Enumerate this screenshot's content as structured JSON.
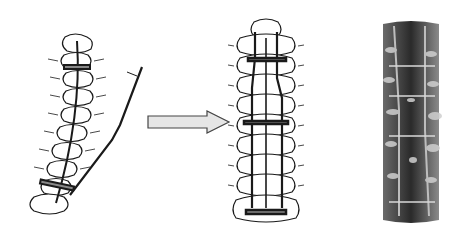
{
  "figure": {
    "panels": [
      {
        "id": "before",
        "label": "Curved spine with single bent rod and hooks (pre-correction)"
      },
      {
        "id": "arrow",
        "label": "Correction direction arrow"
      },
      {
        "id": "after",
        "label": "Straightened spine with dual rods and cross-links (post-correction)"
      },
      {
        "id": "photo",
        "label": "Intraoperative photograph of instrumented spine"
      }
    ],
    "colors": {
      "background": "#ffffff",
      "ink": "#1a1a1a",
      "bone": "#ffffff",
      "arrow_fill": "#e6e6e6",
      "arrow_stroke": "#444444",
      "photo_dark": "#2a2a2a",
      "photo_light": "#cfcfcf"
    }
  }
}
